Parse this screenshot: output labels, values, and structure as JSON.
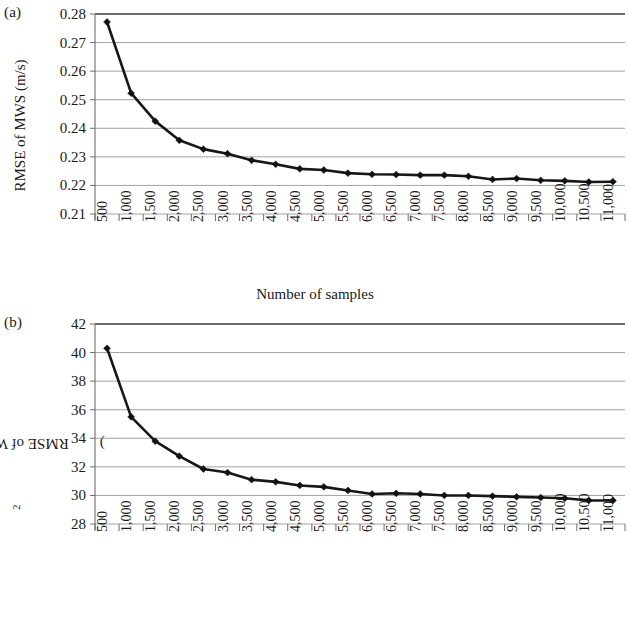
{
  "figure": {
    "panels": [
      {
        "tag": "(a)",
        "ylabel": "RMSE of MWS (m/s)",
        "xlabel": "Number of samples"
      },
      {
        "tag": "(b)",
        "ylabel_prefix": "RMSE of WPD (W/m",
        "ylabel_sup": "2",
        "ylabel_suffix": ")",
        "xlabel": "Number of samples"
      }
    ]
  },
  "chart_data": [
    {
      "type": "line",
      "title": "",
      "panel": "(a)",
      "xlabel": "Number of samples",
      "ylabel": "RMSE of MWS (m/s)",
      "ylim": [
        0.21,
        0.28
      ],
      "ytick_step": 0.01,
      "ytick_labels": [
        "0.28",
        "0.27",
        "0.26",
        "0.25",
        "0.24",
        "0.23",
        "0.22",
        "0.21"
      ],
      "grid": true,
      "legend": "none",
      "marker": "diamond",
      "line_color": "#171717",
      "categories": [
        "500",
        "1,000",
        "1,500",
        "2,000",
        "2,500",
        "3,000",
        "3,500",
        "4,000",
        "4,500",
        "5,000",
        "5,500",
        "6,000",
        "6,500",
        "7,000",
        "7,500",
        "8,000",
        "8,500",
        "9,000",
        "9,500",
        "10,000",
        "10,500",
        "11,000"
      ],
      "x": [
        500,
        1000,
        1500,
        2000,
        2500,
        3000,
        3500,
        4000,
        4500,
        5000,
        5500,
        6000,
        6500,
        7000,
        7500,
        8000,
        8500,
        9000,
        9500,
        10000,
        10500,
        11000
      ],
      "values": [
        0.2772,
        0.2523,
        0.2425,
        0.2358,
        0.2327,
        0.2311,
        0.2288,
        0.2274,
        0.2258,
        0.2254,
        0.2243,
        0.2239,
        0.2238,
        0.2236,
        0.2236,
        0.2232,
        0.2221,
        0.2224,
        0.2218,
        0.2216,
        0.2212,
        0.2213
      ]
    },
    {
      "type": "line",
      "title": "",
      "panel": "(b)",
      "xlabel": "Number of samples",
      "ylabel": "RMSE of WPD (W/m2)",
      "ylim": [
        28,
        42
      ],
      "ytick_step": 2,
      "ytick_labels": [
        "42",
        "40",
        "38",
        "36",
        "34",
        "32",
        "30",
        "28"
      ],
      "grid": true,
      "legend": "none",
      "marker": "diamond",
      "line_color": "#171717",
      "categories": [
        "500",
        "1,000",
        "1,500",
        "2,000",
        "2,500",
        "3,000",
        "3,500",
        "4,000",
        "4,500",
        "5,000",
        "5,500",
        "6,000",
        "6,500",
        "7,000",
        "7,500",
        "8,000",
        "8,500",
        "9,000",
        "9,500",
        "10,000",
        "10,500",
        "11,000"
      ],
      "x": [
        500,
        1000,
        1500,
        2000,
        2500,
        3000,
        3500,
        4000,
        4500,
        5000,
        5500,
        6000,
        6500,
        7000,
        7500,
        8000,
        8500,
        9000,
        9500,
        10000,
        10500,
        11000
      ],
      "values": [
        40.3,
        35.5,
        33.8,
        32.75,
        31.85,
        31.6,
        31.1,
        30.95,
        30.7,
        30.6,
        30.35,
        30.1,
        30.15,
        30.1,
        30.0,
        30.0,
        29.95,
        29.9,
        29.85,
        29.8,
        29.65,
        29.65
      ]
    }
  ]
}
